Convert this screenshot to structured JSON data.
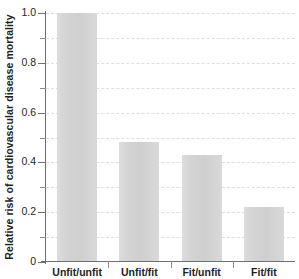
{
  "chart_data": {
    "type": "bar",
    "title": "",
    "xlabel": "",
    "ylabel": "Relative risk of cardiovascular disease mortality",
    "categories": [
      "Unfit/unfit",
      "Unfit/fit",
      "Fit/unfit",
      "Fit/fit"
    ],
    "values": [
      1.0,
      0.48,
      0.43,
      0.22
    ],
    "ylim": [
      0,
      1.0
    ],
    "ytick_labels": [
      "0",
      "0.2",
      "0.4",
      "0.6",
      "0.8",
      "1.0"
    ],
    "ytick_values": [
      0,
      0.2,
      0.4,
      0.6,
      0.8,
      1.0
    ],
    "yminor_values": [
      0.1,
      0.3,
      0.5,
      0.7,
      0.9
    ],
    "grid": "horizontal-dashed",
    "grid_values": [
      0.1,
      0.2,
      0.3,
      0.4,
      0.5,
      0.6,
      0.7,
      0.8,
      0.9,
      1.0
    ],
    "legend": "none",
    "bar_color": "#d5d5d5",
    "axis_color": "#6f6f6f",
    "grid_color": "#dedede",
    "text_color": "#231f20",
    "background": "#ffffff"
  },
  "axis": {
    "y_title": "Relative risk of cardiovascular disease mortality"
  }
}
